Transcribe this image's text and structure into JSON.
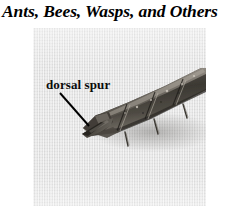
{
  "figure": {
    "title": "Ants, Bees, Wasps, and Others",
    "panel": {
      "type": "photomicrograph",
      "subject": "insect hind tibia apex with dorsal spur",
      "rendering": "grayscale",
      "background_color": "#e3e3e3",
      "specimen_color": "#4a4743"
    },
    "callout": {
      "label": "dorsal spur",
      "leader_line": {
        "from_x": 60,
        "from_y": 93,
        "to_x": 89,
        "to_y": 126,
        "color": "#000000"
      }
    }
  },
  "colors": {
    "title_text": "#000000",
    "label_text": "#0b0b0b",
    "panel_background": "#e3e3e3",
    "specimen_dark": "#38352f",
    "specimen_mid": "#6d6963",
    "specimen_light": "#a9a49c",
    "page_background": "#ffffff"
  }
}
